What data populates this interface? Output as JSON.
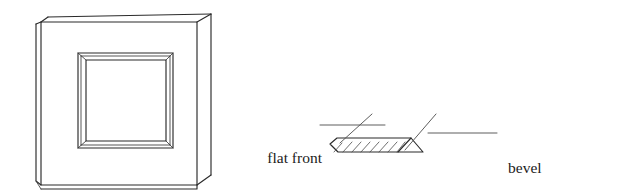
{
  "figure": {
    "background_color": "#ffffff",
    "ink_color": "#2b2b2b",
    "leader_color": "#555555"
  },
  "panel": {
    "name": "bevelled panel perspective view",
    "description": "Square panel drawn in slight perspective showing thickness on the right side and a recessed square with bevelled frame in the centre"
  },
  "cross_section": {
    "name": "bevel cross-section profile",
    "description": "Thin horizontal slab, hatched, with a flat front section on the left and a bevelled chamfer at the right end"
  },
  "labels": {
    "flat_front": {
      "line1": "flat front",
      "line2": "section"
    },
    "bevel": {
      "line1": "bevel",
      "line2": "(cross-section)"
    }
  }
}
